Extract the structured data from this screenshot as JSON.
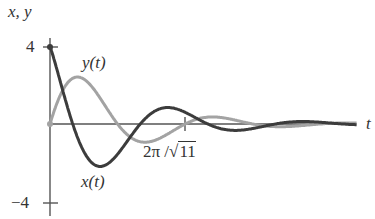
{
  "chart_data": {
    "type": "line",
    "title": "",
    "xlabel": "t",
    "ylabel": "x, y",
    "ylim": [
      -4,
      4
    ],
    "xlim": [
      0,
      4.3
    ],
    "yticks": [
      {
        "value": 4,
        "label": "4"
      },
      {
        "value": -4,
        "label": "−4"
      }
    ],
    "xticks": [
      {
        "value": 1.894,
        "label": "2π/√11"
      }
    ],
    "grid": false,
    "legend": "inline labels",
    "series": [
      {
        "name": "x(t)",
        "color": "#3a3a3a",
        "model": {
          "a": 4,
          "c": -2.26,
          "omega": 3.3166,
          "decay": 1.0
        },
        "x": [
          0,
          0.25,
          0.5,
          0.66,
          1.0,
          1.25,
          1.5,
          1.9,
          2.5,
          3.0,
          3.5,
          4.0,
          4.3
        ],
        "values": [
          4.0,
          1.2,
          -1.6,
          -2.15,
          -1.6,
          -0.6,
          0.25,
          0.55,
          0.1,
          -0.15,
          0.05,
          0.06,
          0.0
        ]
      },
      {
        "name": "y(t)",
        "color": "#9a9a9a",
        "model": {
          "b": 3.7,
          "omega": 3.3166,
          "decay": 1.0
        },
        "x": [
          0,
          0.15,
          0.32,
          0.5,
          0.75,
          0.95,
          1.25,
          1.5,
          1.9,
          2.3,
          3.0,
          3.5,
          4.3
        ],
        "values": [
          0,
          1.5,
          2.36,
          2.2,
          1.1,
          0.0,
          -0.75,
          -0.55,
          0.0,
          0.35,
          -0.15,
          0.0,
          0.0
        ]
      }
    ],
    "annotations": [
      "y(t)",
      "x(t)",
      "2π/√11"
    ]
  },
  "labels": {
    "y_axis": "x, y",
    "x_axis": "t",
    "y_top": "4",
    "y_bottom": "−4",
    "tick_label_prefix": "2π /",
    "tick_label_radicand": "11",
    "series_y": "y(t)",
    "series_x": "x(t)"
  }
}
